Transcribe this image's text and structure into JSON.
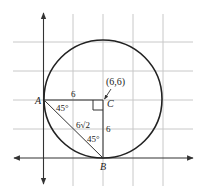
{
  "diagram": {
    "type": "geometry-coordinate-plane",
    "colors": {
      "grid": "#c8c8c8",
      "axis": "#333333",
      "circle": "#222222",
      "text": "#222222"
    },
    "center": {
      "label": "C",
      "coordinate_label": "(6,6)"
    },
    "points": [
      {
        "label": "A"
      },
      {
        "label": "B"
      },
      {
        "label": "C"
      }
    ],
    "segment_labels": {
      "AC": "6",
      "CB": "6",
      "AB": "6√2"
    },
    "angle_labels": {
      "at_A": "45°",
      "at_B": "45°"
    },
    "right_angle_at": "C"
  }
}
